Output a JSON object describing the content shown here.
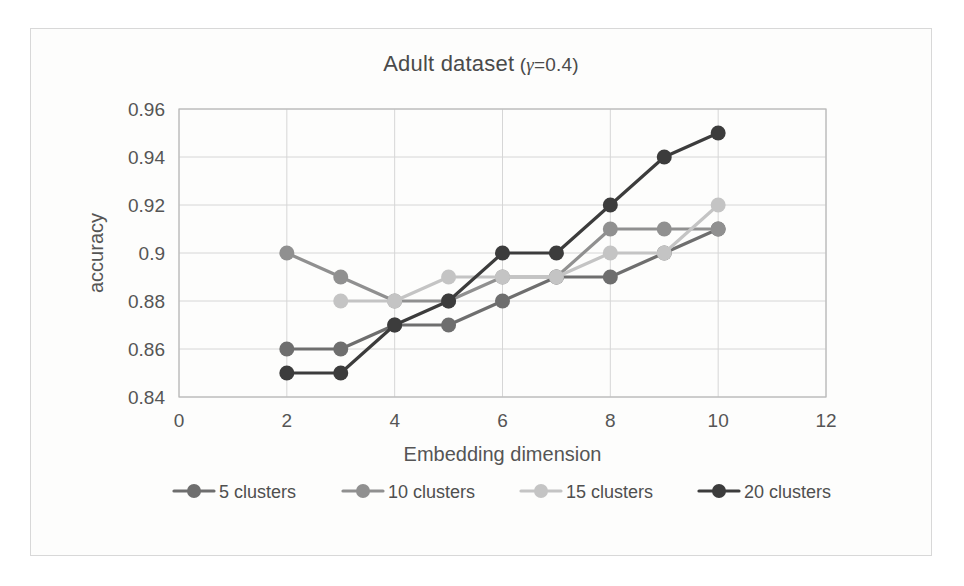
{
  "chart_data": {
    "type": "line",
    "title": "Adult dataset (γ=0.4)",
    "title_prefix": "Adult dataset",
    "title_gamma": "γ",
    "title_gamma_value": "=0.4",
    "xlabel": "Embedding dimension",
    "ylabel": "accuracy",
    "xlim": [
      0,
      12
    ],
    "ylim": [
      0.84,
      0.96
    ],
    "xticks": [
      "0",
      "2",
      "4",
      "6",
      "8",
      "10",
      "12"
    ],
    "xtick_values": [
      0,
      2,
      4,
      6,
      8,
      10,
      12
    ],
    "yticks": [
      "0.84",
      "0.86",
      "0.88",
      "0.9",
      "0.92",
      "0.94",
      "0.96"
    ],
    "ytick_values": [
      0.84,
      0.86,
      0.88,
      0.9,
      0.92,
      0.94,
      0.96
    ],
    "grid": true,
    "grid_axis": "y",
    "legend_position": "bottom",
    "x": [
      2,
      3,
      4,
      5,
      6,
      7,
      8,
      9,
      10
    ],
    "series": [
      {
        "name": "5 clusters",
        "color": "#6e6e6e",
        "x": [
          2,
          3,
          4,
          5,
          6,
          7,
          8,
          9,
          10
        ],
        "values": [
          0.86,
          0.86,
          0.87,
          0.87,
          0.88,
          0.89,
          0.89,
          0.9,
          0.91
        ]
      },
      {
        "name": "10 clusters",
        "color": "#909090",
        "x": [
          2,
          3,
          4,
          5,
          6,
          7,
          8,
          9,
          10
        ],
        "values": [
          0.9,
          0.89,
          0.88,
          0.88,
          0.89,
          0.89,
          0.91,
          0.91,
          0.91
        ]
      },
      {
        "name": "15 clusters",
        "color": "#c4c4c4",
        "x": [
          3,
          4,
          5,
          6,
          7,
          8,
          9,
          10
        ],
        "values": [
          0.88,
          0.88,
          0.89,
          0.89,
          0.89,
          0.9,
          0.9,
          0.92
        ]
      },
      {
        "name": "20 clusters",
        "color": "#3c3c3c",
        "x": [
          2,
          3,
          4,
          5,
          6,
          7,
          8,
          9,
          10
        ],
        "values": [
          0.85,
          0.85,
          0.87,
          0.88,
          0.9,
          0.9,
          0.92,
          0.94,
          0.95
        ]
      }
    ]
  },
  "legend": {
    "items": [
      {
        "label": "5 clusters",
        "color": "#6e6e6e"
      },
      {
        "label": "10 clusters",
        "color": "#909090"
      },
      {
        "label": "15 clusters",
        "color": "#c4c4c4"
      },
      {
        "label": "20 clusters",
        "color": "#3c3c3c"
      }
    ]
  },
  "colors": {
    "gridline": "#d6d6d6",
    "border": "#b9b9b9",
    "text": "#555555",
    "background": "#fdfdfc"
  }
}
